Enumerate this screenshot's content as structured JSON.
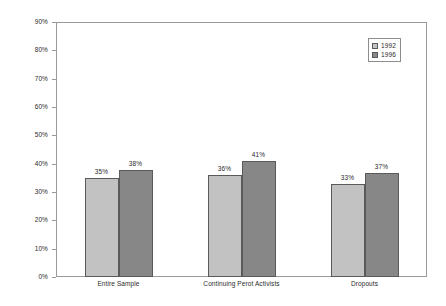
{
  "chart_data": {
    "type": "bar",
    "title": "",
    "subtitle": "",
    "xlabel": "",
    "ylabel": "",
    "categories": [
      "Entire Sample",
      "Continuing Perot Activists",
      "Dropouts"
    ],
    "series": [
      {
        "name": "1992",
        "color": "#c2c2c2",
        "values": [
          35,
          36,
          33
        ],
        "labels": [
          "35%",
          "36%",
          "33%"
        ]
      },
      {
        "name": "1996",
        "color": "#878787",
        "values": [
          38,
          41,
          37
        ],
        "labels": [
          "38%",
          "41%",
          "37%"
        ]
      }
    ],
    "ylim": [
      0,
      90
    ],
    "ytick_values": [
      0,
      10,
      20,
      30,
      40,
      50,
      60,
      70,
      80,
      90
    ],
    "ytick_labels": [
      "0%",
      "10%",
      "20%",
      "30%",
      "40%",
      "50%",
      "60%",
      "70%",
      "80%",
      "90%"
    ],
    "grid": false,
    "legend_position": "top-right",
    "value_labels_shown": true,
    "units": "percent"
  },
  "legend": {
    "entries": [
      {
        "label": "1992",
        "color": "#c2c2c2"
      },
      {
        "label": "1996",
        "color": "#878787"
      }
    ]
  },
  "colors": {
    "series_1992": "#c2c2c2",
    "series_1996": "#878787",
    "frame": "#9a9a9a",
    "bar_outline": "#5a5a5a",
    "text": "#2b2b2b",
    "background": "#ffffff"
  }
}
